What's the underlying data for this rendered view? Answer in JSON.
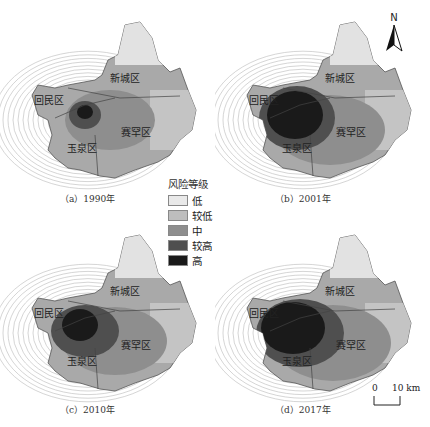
{
  "figure": {
    "panels": [
      {
        "caption": "（a）1990年",
        "year": "1990"
      },
      {
        "caption": "（b）2001年",
        "year": "2001"
      },
      {
        "caption": "（c）2010年",
        "year": "2010"
      },
      {
        "caption": "（d）2017年",
        "year": "2017"
      }
    ],
    "districts": {
      "xincheng": "新城区",
      "huimin": "回民区",
      "saihan": "赛罕区",
      "yuquan": "玉泉区"
    },
    "legend": {
      "title": "风险等级",
      "items": [
        {
          "label": "低",
          "color": "#e9e9e9"
        },
        {
          "label": "较低",
          "color": "#bdbdbd"
        },
        {
          "label": "中",
          "color": "#8e8e8e"
        },
        {
          "label": "较高",
          "color": "#4f4f4f"
        },
        {
          "label": "高",
          "color": "#1a1a1a"
        }
      ]
    },
    "north_arrow": {
      "label": "N"
    },
    "scale_bar": {
      "start": "0",
      "end": "10 km"
    }
  }
}
